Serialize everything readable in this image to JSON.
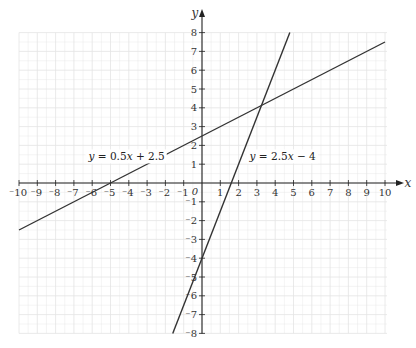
{
  "chart_data": {
    "type": "line",
    "title": "",
    "xlabel": "x",
    "ylabel": "y",
    "xlim": [
      -10,
      10
    ],
    "ylim": [
      -8,
      8
    ],
    "grid": true,
    "x_ticks": [
      -10,
      -9,
      -8,
      -7,
      -6,
      -5,
      -4,
      -3,
      -2,
      -1,
      1,
      2,
      3,
      4,
      5,
      6,
      7,
      8,
      9,
      10
    ],
    "y_ticks": [
      -8,
      -7,
      -6,
      -5,
      -4,
      -3,
      -2,
      -1,
      1,
      2,
      3,
      4,
      5,
      6,
      7,
      8
    ],
    "origin_label": "0",
    "series": [
      {
        "name": "y = 0.5x + 2.5",
        "slope": 0.5,
        "intercept": 2.5,
        "x": [
          -10,
          10
        ],
        "y": [
          -2.5,
          7.5
        ],
        "label_position": {
          "x": -6.2,
          "y": 1.2
        }
      },
      {
        "name": "y = 2.5x − 4",
        "slope": 2.5,
        "intercept": -4,
        "x": [
          -1.6,
          4.8
        ],
        "y": [
          -8,
          8
        ],
        "label_position": {
          "x": 2.6,
          "y": 1.2
        }
      }
    ],
    "annotations": [
      "y = 0.5x + 2.5",
      "y = 2.5x − 4"
    ],
    "colors": {
      "line": "#333333",
      "axis": "#222222",
      "grid": "#e4e4e4"
    }
  }
}
